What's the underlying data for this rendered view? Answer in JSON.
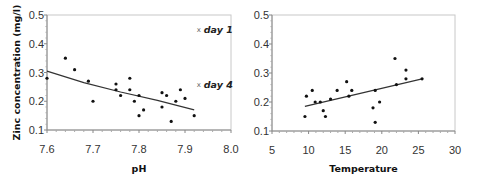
{
  "chart_data": [
    {
      "type": "scatter",
      "title": "",
      "xlabel": "pH",
      "ylabel": "Zinc concentration (mg/l)",
      "xlim": [
        7.6,
        8.0
      ],
      "ylim": [
        0.1,
        0.5
      ],
      "xticks": [
        "7.6",
        "7.7",
        "7.8",
        "7.9",
        "8.0"
      ],
      "yticks": [
        "0.1",
        "0.2",
        "0.3",
        "0.4",
        "0.5"
      ],
      "grid": false,
      "points": [
        [
          7.6,
          0.28
        ],
        [
          7.64,
          0.35
        ],
        [
          7.66,
          0.31
        ],
        [
          7.69,
          0.27
        ],
        [
          7.7,
          0.2
        ],
        [
          7.75,
          0.26
        ],
        [
          7.75,
          0.24
        ],
        [
          7.76,
          0.22
        ],
        [
          7.78,
          0.28
        ],
        [
          7.78,
          0.24
        ],
        [
          7.79,
          0.2
        ],
        [
          7.8,
          0.22
        ],
        [
          7.8,
          0.15
        ],
        [
          7.81,
          0.17
        ],
        [
          7.85,
          0.23
        ],
        [
          7.85,
          0.18
        ],
        [
          7.86,
          0.22
        ],
        [
          7.87,
          0.13
        ],
        [
          7.88,
          0.2
        ],
        [
          7.89,
          0.24
        ],
        [
          7.9,
          0.21
        ],
        [
          7.92,
          0.15
        ]
      ],
      "trendline": [
        [
          7.6,
          0.305
        ],
        [
          7.68,
          0.265
        ],
        [
          7.76,
          0.232
        ],
        [
          7.84,
          0.203
        ],
        [
          7.92,
          0.17
        ]
      ],
      "annotations": [
        {
          "text": "day 1",
          "marker": "x",
          "x": 7.93,
          "y": 0.45
        },
        {
          "text": "day 4",
          "marker": "x",
          "x": 7.93,
          "y": 0.26
        }
      ]
    },
    {
      "type": "scatter",
      "title": "",
      "xlabel": "Temperature",
      "ylabel": "",
      "xlim": [
        5,
        30
      ],
      "ylim": [
        0.1,
        0.5
      ],
      "xticks": [
        "5",
        "10",
        "15",
        "20",
        "25",
        "30"
      ],
      "yticks": [
        "0.1",
        "0.2",
        "0.3",
        "0.4",
        "0.5"
      ],
      "grid": false,
      "points": [
        [
          9.5,
          0.15
        ],
        [
          9.7,
          0.22
        ],
        [
          10.5,
          0.24
        ],
        [
          10.9,
          0.2
        ],
        [
          11.6,
          0.2
        ],
        [
          12.0,
          0.17
        ],
        [
          12.3,
          0.15
        ],
        [
          13.0,
          0.21
        ],
        [
          13.9,
          0.24
        ],
        [
          15.2,
          0.27
        ],
        [
          15.5,
          0.22
        ],
        [
          15.9,
          0.24
        ],
        [
          18.8,
          0.18
        ],
        [
          19.1,
          0.13
        ],
        [
          19.1,
          0.24
        ],
        [
          19.7,
          0.2
        ],
        [
          21.8,
          0.35
        ],
        [
          22.0,
          0.26
        ],
        [
          23.3,
          0.31
        ],
        [
          23.3,
          0.28
        ],
        [
          25.5,
          0.28
        ]
      ],
      "trendline": [
        [
          9.5,
          0.185
        ],
        [
          25.5,
          0.28
        ]
      ]
    }
  ]
}
